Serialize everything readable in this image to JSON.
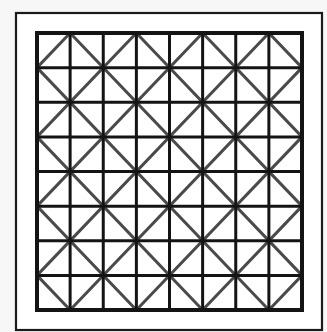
{
  "figure": {
    "background": "#f7f7f7",
    "frame": {
      "x": 16,
      "y": 13,
      "w": 306,
      "h": 317,
      "stroke": "#1a1a1a",
      "stroke_width": 2.2,
      "fill": "#ffffff"
    },
    "grid": {
      "x": 37,
      "y": 33,
      "w": 265,
      "h": 277,
      "rows": 8,
      "cols": 8,
      "line_color": "#141414",
      "line_width": 3,
      "border_width": 4
    },
    "diagonals": {
      "color": "#4a4a4a",
      "width": 3,
      "pattern": "diamond lattice through midpoints of 2x2 cell blocks"
    }
  }
}
